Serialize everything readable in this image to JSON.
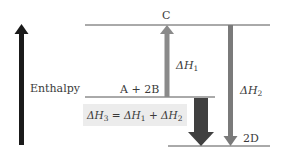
{
  "axis": {
    "label": "Enthalpy",
    "arrow_color": "#1a1a1a"
  },
  "levels": {
    "top": {
      "label": "C"
    },
    "middle": {
      "label": "A + 2B"
    },
    "bottom": {
      "label": "2D"
    }
  },
  "arrows": {
    "dh1": {
      "symbol": "ΔH",
      "sub": "1",
      "direction": "up",
      "color": "#8a8a8a"
    },
    "dh2": {
      "symbol": "ΔH",
      "sub": "2",
      "direction": "down",
      "color": "#7a7a7a"
    },
    "dh3": {
      "direction": "down",
      "color": "#404040"
    }
  },
  "equation": {
    "lhs_symbol": "ΔH",
    "lhs_sub": "3",
    "equals": " = ",
    "t1_symbol": "ΔH",
    "t1_sub": "1",
    "plus": " + ",
    "t2_symbol": "ΔH",
    "t2_sub": "2",
    "box_color": "#ececec"
  }
}
